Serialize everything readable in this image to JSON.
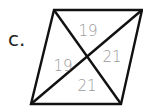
{
  "label": "c.",
  "figure": {
    "shape": "parallelogram",
    "vertices": {
      "top_left": [
        54,
        10
      ],
      "top_right": [
        142,
        10
      ],
      "bottom_right": [
        121,
        104
      ],
      "bottom_left": [
        31,
        104
      ]
    },
    "diagonals": true,
    "segments": {
      "top": "19",
      "right": "21",
      "left": "19",
      "bottom": "21"
    },
    "colors": {
      "outline": "#111111",
      "segment_text": "#9a9a9a",
      "label_text": "#222222"
    }
  }
}
